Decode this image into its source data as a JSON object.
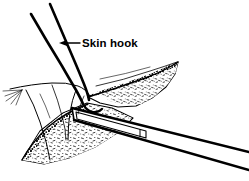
{
  "figure": {
    "type": "medical-line-illustration",
    "background_color": "#ffffff",
    "ink_color": "#000000",
    "width": 249,
    "height": 181,
    "annotations": [
      {
        "id": "skin-hook",
        "label": "Skin hook",
        "text_x": 82,
        "text_y": 47,
        "leader_line": {
          "x1": 78,
          "y1": 43,
          "x2": 62,
          "y2": 43
        },
        "arrow_tip": {
          "x": 60,
          "y": 43
        },
        "arrow_direction": "left"
      }
    ],
    "elements": [
      {
        "id": "skin-hook-shaft",
        "name": "skin-hook-shaft",
        "description": "Two long parallel strokes angling from upper left down to the wound, bending at the tip"
      },
      {
        "id": "skin-hook-tip",
        "name": "skin-hook-tip",
        "description": "Curved hook end engaging the retracted skin edge"
      },
      {
        "id": "upper-tissue-flap",
        "name": "upper-tissue-flap",
        "description": "Upper reflected flap with dark granular cut margin and stippled dermal surface, tapering to a point at right"
      },
      {
        "id": "lower-tissue-flap",
        "name": "lower-tissue-flap",
        "description": "Lower reflected flap with dense stippling, pointed toward lower left"
      },
      {
        "id": "skin-surface-left",
        "name": "skin-surface-left",
        "description": "Intact skin contour at left with fine splayed hair strokes"
      },
      {
        "id": "scalpel-instrument",
        "name": "scalpel-instrument",
        "description": "Straight instrument shaft crossing the wound diagonally and exiting the lower right corner"
      },
      {
        "id": "scalpel-blade",
        "name": "scalpel-blade",
        "description": "Flat blade segment of the instrument inside the wound"
      }
    ]
  }
}
